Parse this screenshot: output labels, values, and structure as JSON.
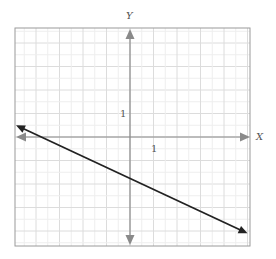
{
  "chart_data": {
    "type": "line",
    "title": "",
    "xlabel": "X",
    "ylabel": "Y",
    "x_tick_labels": [
      "1"
    ],
    "y_tick_labels": [
      "1"
    ],
    "xlim": [
      -4.85,
      5.1
    ],
    "ylim": [
      -4.6,
      4.6
    ],
    "grid": true,
    "series": [
      {
        "name": "line",
        "x": [
          -4.85,
          5.0
        ],
        "y": [
          0.5,
          -4.1
        ],
        "approx_equation": "y = -0.47x - 1.8",
        "arrows_both_ends": true,
        "color": "#222222"
      }
    ]
  },
  "labels": {
    "x_axis": "X",
    "y_axis": "Y",
    "x_tick": "1",
    "y_tick": "1"
  },
  "colors": {
    "frame": "#9a9a9a",
    "grid": "#e6e6e6",
    "axis": "#8a8a8a",
    "line": "#222222"
  }
}
